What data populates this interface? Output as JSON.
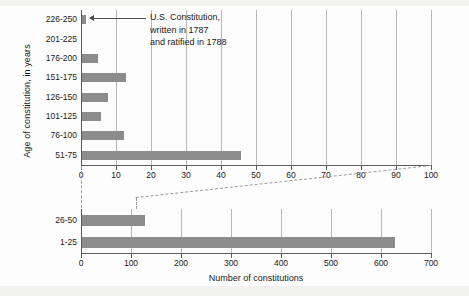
{
  "chart_data": {
    "type": "bar",
    "orientation": "horizontal",
    "title": "",
    "xlabel": "Number of constitutions",
    "ylabel": "Age of constitution, in years",
    "grid": true,
    "legend": null,
    "note": "Broken-axis chart: upper panel 0-100, lower panel 0-700, both sharing the category axis 'Age of constitution, in years'.",
    "panels": [
      {
        "name": "upper-panel",
        "xlim": [
          0,
          100
        ],
        "xticks": [
          0,
          10,
          20,
          30,
          40,
          50,
          60,
          70,
          80,
          90,
          100
        ],
        "xtick_labels": [
          "0",
          "10",
          "20",
          "30",
          "40",
          "50",
          "60",
          "70",
          "80",
          "90",
          "100"
        ],
        "categories": [
          "226-250",
          "201-225",
          "176-200",
          "151-175",
          "126-150",
          "101-125",
          "76-100",
          "51-75"
        ],
        "values": [
          1,
          0,
          4.5,
          12.5,
          7.5,
          5.5,
          12,
          45.5
        ]
      },
      {
        "name": "lower-panel",
        "xlim": [
          0,
          700
        ],
        "xticks": [
          0,
          100,
          200,
          300,
          400,
          500,
          600,
          700
        ],
        "xtick_labels": [
          "0",
          "100",
          "200",
          "300",
          "400",
          "500",
          "600",
          "700"
        ],
        "categories": [
          "26-50",
          "1-25"
        ],
        "values": [
          125,
          625
        ]
      }
    ],
    "annotations": [
      {
        "name": "us-constitution-callout",
        "target_category": "226-250",
        "lines": [
          "U.S. Constitution,",
          "written in 1787",
          "and ratified in 1788"
        ]
      }
    ],
    "colors": {
      "bar": "#8c8c8c",
      "axis": "#5a5a5a",
      "gridline": "#b8b8b8",
      "text": "#1a1a1a",
      "background": "#fdfdfd",
      "dash": "#9a9a9a"
    }
  },
  "labels": {
    "y_axis_title": "Age of constitution, in years",
    "x_axis_title": "Number of constitutions",
    "annotation_line_1": "U.S. Constitution,",
    "annotation_line_2": "written in 1787",
    "annotation_line_3": "and ratified in 1788"
  }
}
